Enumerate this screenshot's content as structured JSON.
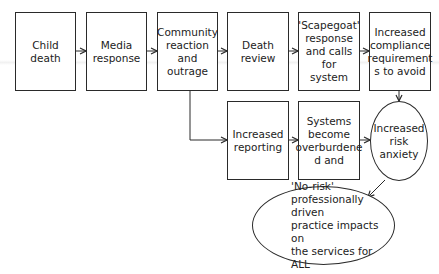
{
  "diagram": {
    "type": "flowchart",
    "row1": [
      {
        "id": "child-death",
        "label": "Child\ndeath"
      },
      {
        "id": "media-response",
        "label": "Media\nresponse"
      },
      {
        "id": "community-reaction",
        "label": "Community\nreaction and\noutrage"
      },
      {
        "id": "death-review",
        "label": "Death\nreview"
      },
      {
        "id": "scapegoat-response",
        "label": "'Scapegoat'\nresponse\nand calls for\nsystem"
      },
      {
        "id": "increased-compliance",
        "label": "Increased\ncompliance\nrequirement\ns to avoid"
      }
    ],
    "row2": [
      {
        "id": "increased-reporting",
        "label": "Increased\nreporting"
      },
      {
        "id": "systems-overburdened",
        "label": "Systems\nbecome\noverburdene\nd and"
      }
    ],
    "ellipses": [
      {
        "id": "increased-risk-anxiety",
        "label": "Increased\nrisk anxiety"
      },
      {
        "id": "no-risk-practice",
        "label": "'No-risk'\nprofessionally driven\npractice impacts on\nthe services for ALL"
      }
    ],
    "edges": [
      [
        "child-death",
        "media-response"
      ],
      [
        "media-response",
        "community-reaction"
      ],
      [
        "community-reaction",
        "death-review"
      ],
      [
        "death-review",
        "scapegoat-response"
      ],
      [
        "scapegoat-response",
        "increased-compliance"
      ],
      [
        "community-reaction",
        "increased-reporting"
      ],
      [
        "increased-reporting",
        "systems-overburdened"
      ],
      [
        "systems-overburdened",
        "increased-risk-anxiety"
      ],
      [
        "increased-compliance",
        "increased-risk-anxiety"
      ],
      [
        "increased-risk-anxiety",
        "no-risk-practice"
      ]
    ]
  },
  "colors": {
    "stroke": "#2a2a2a",
    "text": "#222222",
    "background": "#ffffff"
  }
}
